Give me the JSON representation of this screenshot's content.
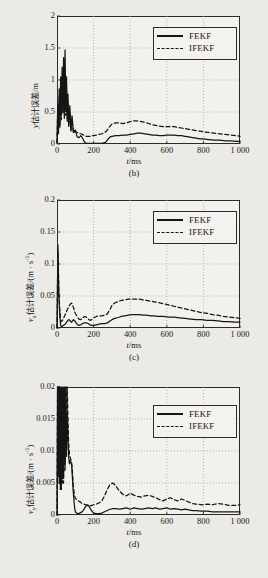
{
  "figure": {
    "background_color": "#eceae6",
    "plot_background_color": "#f3f1ee",
    "line_color": "#151515",
    "grid_color": "#9a9a9a"
  },
  "legend": {
    "series": [
      {
        "label": "FEKF",
        "style": "solid"
      },
      {
        "label": "IFEKF",
        "style": "dashed"
      }
    ]
  },
  "chart_data": [
    {
      "type": "line",
      "panel": "b",
      "caption": "(b)",
      "title": "",
      "xlabel": "t/ms",
      "ylabel": "y估计误差/m",
      "ylabel_html": "<span class='it'>y</span>估计误差/m",
      "xlim": [
        0,
        1000
      ],
      "ylim": [
        0,
        2
      ],
      "xticks": [
        0,
        200,
        400,
        600,
        800,
        1000
      ],
      "xticklabels": [
        "0",
        "200",
        "400",
        "600",
        "800",
        "1 000"
      ],
      "yticks": [
        0,
        0.5,
        1,
        1.5,
        2
      ],
      "yticklabels": [
        "0",
        "0.5",
        "1",
        "1.5",
        "2"
      ],
      "grid": true,
      "legend_position": "top-right",
      "series": [
        {
          "name": "FEKF",
          "style": "solid",
          "x": [
            0,
            4,
            8,
            12,
            16,
            20,
            24,
            28,
            32,
            36,
            40,
            44,
            48,
            52,
            56,
            60,
            64,
            70,
            76,
            82,
            90,
            100,
            110,
            120,
            130,
            140,
            150,
            160,
            170,
            180,
            190,
            200,
            215,
            230,
            245,
            260,
            270,
            280,
            290,
            300,
            320,
            340,
            360,
            380,
            400,
            420,
            440,
            460,
            480,
            500,
            520,
            540,
            560,
            580,
            600,
            620,
            640,
            660,
            680,
            700,
            720,
            740,
            760,
            780,
            800,
            830,
            860,
            890,
            920,
            950,
            980,
            1000
          ],
          "y": [
            0.02,
            0.62,
            0.18,
            0.86,
            0.3,
            1.05,
            0.44,
            1.2,
            0.55,
            1.35,
            0.46,
            1.47,
            0.52,
            1.05,
            0.4,
            0.78,
            0.3,
            0.6,
            0.22,
            0.44,
            0.18,
            0.22,
            0.11,
            0.1,
            0.13,
            0.09,
            0.03,
            0.01,
            0.01,
            0.01,
            0.01,
            0.01,
            0.01,
            0.01,
            0.01,
            0.02,
            0.04,
            0.08,
            0.11,
            0.12,
            0.13,
            0.13,
            0.14,
            0.14,
            0.15,
            0.16,
            0.17,
            0.17,
            0.16,
            0.15,
            0.14,
            0.14,
            0.13,
            0.13,
            0.14,
            0.14,
            0.14,
            0.13,
            0.13,
            0.12,
            0.11,
            0.1,
            0.09,
            0.08,
            0.08,
            0.07,
            0.06,
            0.06,
            0.05,
            0.05,
            0.04,
            0.04
          ]
        },
        {
          "name": "IFEKF",
          "style": "dashed",
          "x": [
            0,
            4,
            8,
            12,
            16,
            20,
            24,
            28,
            32,
            36,
            40,
            44,
            48,
            52,
            56,
            60,
            64,
            70,
            76,
            82,
            90,
            100,
            110,
            120,
            130,
            140,
            150,
            160,
            170,
            180,
            190,
            200,
            215,
            230,
            245,
            260,
            270,
            280,
            290,
            300,
            320,
            340,
            360,
            380,
            400,
            420,
            440,
            460,
            480,
            500,
            520,
            540,
            560,
            580,
            600,
            620,
            640,
            660,
            680,
            700,
            720,
            740,
            760,
            780,
            800,
            830,
            860,
            890,
            920,
            950,
            980,
            1000
          ],
          "y": [
            0.02,
            0.52,
            0.16,
            0.74,
            0.26,
            0.92,
            0.38,
            1.02,
            0.48,
            1.1,
            0.4,
            1.18,
            0.44,
            0.88,
            0.34,
            0.66,
            0.26,
            0.5,
            0.2,
            0.38,
            0.17,
            0.2,
            0.18,
            0.17,
            0.16,
            0.15,
            0.13,
            0.12,
            0.12,
            0.12,
            0.13,
            0.13,
            0.14,
            0.15,
            0.16,
            0.18,
            0.2,
            0.24,
            0.28,
            0.31,
            0.33,
            0.33,
            0.32,
            0.33,
            0.35,
            0.36,
            0.36,
            0.35,
            0.34,
            0.32,
            0.3,
            0.29,
            0.28,
            0.27,
            0.27,
            0.27,
            0.27,
            0.26,
            0.25,
            0.24,
            0.23,
            0.22,
            0.21,
            0.2,
            0.19,
            0.18,
            0.17,
            0.16,
            0.15,
            0.14,
            0.13,
            0.12
          ]
        }
      ]
    },
    {
      "type": "line",
      "panel": "c",
      "caption": "(c)",
      "title": "",
      "xlabel": "t/ms",
      "ylabel": "vx估计误差/(m · s-1)",
      "ylabel_html": "<span class='it'>v</span><span class='sub'>x</span>估计误差/(m · s<span class='sup'>-1</span>)",
      "xlim": [
        0,
        1000
      ],
      "ylim": [
        0,
        0.2
      ],
      "xticks": [
        0,
        200,
        400,
        600,
        800,
        1000
      ],
      "xticklabels": [
        "0",
        "200",
        "400",
        "600",
        "800",
        "1 000"
      ],
      "yticks": [
        0,
        0.05,
        0.1,
        0.15,
        0.2
      ],
      "yticklabels": [
        "0",
        "0.05",
        "0.1",
        "0.15",
        "0.2"
      ],
      "grid": true,
      "legend_position": "top-right",
      "series": [
        {
          "name": "FEKF",
          "style": "solid",
          "x": [
            0,
            5,
            10,
            15,
            20,
            25,
            30,
            35,
            40,
            45,
            50,
            55,
            60,
            65,
            70,
            75,
            80,
            85,
            90,
            95,
            100,
            110,
            120,
            130,
            140,
            150,
            160,
            170,
            180,
            190,
            200,
            215,
            230,
            245,
            260,
            275,
            290,
            300,
            315,
            330,
            350,
            370,
            390,
            410,
            430,
            450,
            470,
            490,
            510,
            530,
            550,
            580,
            610,
            640,
            670,
            700,
            730,
            760,
            790,
            820,
            850,
            880,
            910,
            940,
            970,
            1000
          ],
          "y": [
            0.0,
            0.12,
            0.05,
            0.02,
            0.004,
            0.002,
            0.003,
            0.004,
            0.005,
            0.006,
            0.008,
            0.01,
            0.012,
            0.013,
            0.012,
            0.01,
            0.009,
            0.011,
            0.013,
            0.012,
            0.01,
            0.006,
            0.004,
            0.005,
            0.007,
            0.008,
            0.008,
            0.007,
            0.005,
            0.004,
            0.004,
            0.005,
            0.006,
            0.007,
            0.007,
            0.008,
            0.011,
            0.013,
            0.015,
            0.016,
            0.018,
            0.019,
            0.02,
            0.021,
            0.021,
            0.021,
            0.02,
            0.02,
            0.019,
            0.019,
            0.018,
            0.018,
            0.017,
            0.017,
            0.016,
            0.015,
            0.014,
            0.013,
            0.013,
            0.012,
            0.012,
            0.011,
            0.01,
            0.01,
            0.009,
            0.009
          ]
        },
        {
          "name": "IFEKF",
          "style": "dashed",
          "x": [
            0,
            5,
            10,
            15,
            20,
            25,
            30,
            35,
            40,
            45,
            50,
            55,
            60,
            65,
            70,
            75,
            80,
            85,
            90,
            95,
            100,
            110,
            120,
            130,
            140,
            150,
            160,
            170,
            180,
            190,
            200,
            215,
            230,
            245,
            260,
            275,
            290,
            300,
            315,
            330,
            350,
            370,
            390,
            410,
            430,
            450,
            470,
            490,
            510,
            530,
            550,
            580,
            610,
            640,
            670,
            700,
            730,
            760,
            790,
            820,
            850,
            880,
            910,
            940,
            970,
            1000
          ],
          "y": [
            0.0,
            0.13,
            0.06,
            0.03,
            0.012,
            0.01,
            0.012,
            0.015,
            0.018,
            0.021,
            0.024,
            0.028,
            0.031,
            0.034,
            0.036,
            0.038,
            0.039,
            0.036,
            0.032,
            0.027,
            0.023,
            0.018,
            0.014,
            0.013,
            0.016,
            0.018,
            0.017,
            0.014,
            0.012,
            0.013,
            0.016,
            0.018,
            0.019,
            0.019,
            0.02,
            0.022,
            0.029,
            0.035,
            0.039,
            0.041,
            0.043,
            0.044,
            0.045,
            0.045,
            0.045,
            0.045,
            0.044,
            0.043,
            0.042,
            0.041,
            0.04,
            0.038,
            0.036,
            0.034,
            0.032,
            0.03,
            0.028,
            0.026,
            0.024,
            0.023,
            0.021,
            0.02,
            0.018,
            0.017,
            0.016,
            0.015
          ]
        }
      ]
    },
    {
      "type": "line",
      "panel": "d",
      "caption": "(d)",
      "title": "",
      "xlabel": "t/ms",
      "ylabel": "vy估计误差/(m · s-1)",
      "ylabel_html": "<span class='it'>v</span><span class='sub'>y</span>估计误差/(m · s<span class='sup'>-1</span>)",
      "xlim": [
        0,
        1000
      ],
      "ylim": [
        0,
        0.02
      ],
      "xticks": [
        0,
        200,
        400,
        600,
        800,
        1000
      ],
      "xticklabels": [
        "0",
        "200",
        "400",
        "600",
        "800",
        "1 000"
      ],
      "yticks": [
        0,
        0.005,
        0.01,
        0.015,
        0.02
      ],
      "yticklabels": [
        "0",
        "0.005",
        "0.01",
        "0.015",
        "0.02"
      ],
      "grid": true,
      "legend_position": "top-right",
      "series": [
        {
          "name": "FEKF",
          "style": "solid",
          "x": [
            0,
            3,
            6,
            9,
            12,
            15,
            18,
            21,
            24,
            27,
            30,
            33,
            36,
            40,
            44,
            48,
            52,
            56,
            60,
            64,
            68,
            72,
            76,
            80,
            84,
            88,
            92,
            96,
            100,
            108,
            116,
            124,
            132,
            140,
            148,
            156,
            164,
            172,
            180,
            190,
            200,
            215,
            230,
            245,
            260,
            275,
            290,
            305,
            320,
            340,
            360,
            380,
            400,
            420,
            440,
            460,
            480,
            500,
            520,
            540,
            560,
            580,
            600,
            620,
            640,
            660,
            680,
            700,
            720,
            740,
            760,
            790,
            820,
            850,
            880,
            910,
            940,
            970,
            1000
          ],
          "y": [
            0.0,
            0.02,
            0.007,
            0.02,
            0.006,
            0.02,
            0.005,
            0.02,
            0.005,
            0.02,
            0.006,
            0.02,
            0.006,
            0.02,
            0.008,
            0.02,
            0.01,
            0.016,
            0.012,
            0.009,
            0.008,
            0.0085,
            0.0082,
            0.0078,
            0.006,
            0.004,
            0.0025,
            0.0012,
            0.0005,
            0.0003,
            0.0002,
            0.0003,
            0.0004,
            0.0006,
            0.0009,
            0.0013,
            0.0016,
            0.0015,
            0.0011,
            0.0006,
            0.0003,
            0.0002,
            0.0002,
            0.0003,
            0.0005,
            0.0007,
            0.0009,
            0.001,
            0.001,
            0.0009,
            0.001,
            0.0011,
            0.0009,
            0.0011,
            0.001,
            0.0009,
            0.001,
            0.0011,
            0.001,
            0.0011,
            0.0009,
            0.001,
            0.0011,
            0.0009,
            0.001,
            0.0009,
            0.0008,
            0.0009,
            0.0008,
            0.0007,
            0.0007,
            0.0006,
            0.0006,
            0.0005,
            0.0005,
            0.0005,
            0.0005,
            0.0005,
            0.0005
          ]
        },
        {
          "name": "IFEKF",
          "style": "dashed",
          "x": [
            0,
            3,
            6,
            9,
            12,
            15,
            18,
            21,
            24,
            27,
            30,
            33,
            36,
            40,
            44,
            48,
            52,
            56,
            60,
            64,
            68,
            72,
            76,
            80,
            84,
            88,
            92,
            96,
            100,
            108,
            116,
            124,
            132,
            140,
            148,
            156,
            164,
            172,
            180,
            190,
            200,
            215,
            230,
            245,
            260,
            275,
            290,
            305,
            320,
            340,
            360,
            380,
            400,
            420,
            440,
            460,
            480,
            500,
            520,
            540,
            560,
            580,
            600,
            620,
            640,
            660,
            680,
            700,
            720,
            740,
            760,
            790,
            820,
            850,
            880,
            910,
            940,
            970,
            1000
          ],
          "y": [
            0.0,
            0.02,
            0.006,
            0.02,
            0.005,
            0.02,
            0.004,
            0.02,
            0.004,
            0.02,
            0.005,
            0.02,
            0.005,
            0.02,
            0.007,
            0.02,
            0.009,
            0.02,
            0.015,
            0.011,
            0.0095,
            0.009,
            0.0086,
            0.0082,
            0.007,
            0.0052,
            0.0038,
            0.003,
            0.0026,
            0.0024,
            0.0022,
            0.0021,
            0.0019,
            0.0018,
            0.0017,
            0.0016,
            0.0015,
            0.0014,
            0.0014,
            0.0015,
            0.0016,
            0.0017,
            0.0019,
            0.0022,
            0.003,
            0.004,
            0.0048,
            0.005,
            0.0046,
            0.0038,
            0.0032,
            0.003,
            0.0034,
            0.0031,
            0.0029,
            0.0028,
            0.003,
            0.0031,
            0.0029,
            0.0027,
            0.0024,
            0.0022,
            0.0025,
            0.0027,
            0.0024,
            0.0022,
            0.0025,
            0.0023,
            0.002,
            0.0018,
            0.0017,
            0.0016,
            0.0017,
            0.0016,
            0.0018,
            0.0017,
            0.0015,
            0.0015,
            0.0016
          ]
        }
      ]
    }
  ]
}
